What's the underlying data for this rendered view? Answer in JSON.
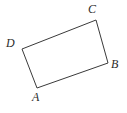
{
  "figure": {
    "type": "quadrilateral-diagram",
    "canvas": {
      "width": 127,
      "height": 113,
      "background": "#ffffff"
    },
    "stroke": {
      "color": "#3a3a3a",
      "width": 1
    },
    "vertices": [
      {
        "id": "A",
        "label": "A",
        "x": 37,
        "y": 88,
        "label_x": 32,
        "label_y": 91
      },
      {
        "id": "B",
        "label": "B",
        "x": 108,
        "y": 63,
        "label_x": 111,
        "label_y": 58
      },
      {
        "id": "C",
        "label": "C",
        "x": 96,
        "y": 20,
        "label_x": 88,
        "label_y": 3
      },
      {
        "id": "D",
        "label": "D",
        "x": 22,
        "y": 49,
        "label_x": 6,
        "label_y": 37
      }
    ],
    "edges": [
      {
        "from": "A",
        "to": "B"
      },
      {
        "from": "B",
        "to": "C"
      },
      {
        "from": "C",
        "to": "D"
      },
      {
        "from": "D",
        "to": "A"
      }
    ],
    "path": "M 37 88 L 108 63 L 96 20 L 22 49 Z"
  }
}
